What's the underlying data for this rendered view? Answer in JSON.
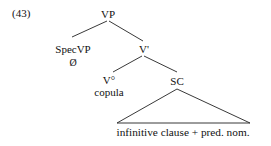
{
  "example_number": "(43)",
  "tree": {
    "root": "VP",
    "spec": {
      "label": "SpecVP",
      "content": "Ø"
    },
    "vbar": "V'",
    "head": {
      "label": "V°",
      "content": "copula"
    },
    "complement": {
      "label": "SC",
      "content": "infinitive clause + pred. nom."
    }
  },
  "colors": {
    "ink": "#111111",
    "background": "#ffffff"
  }
}
